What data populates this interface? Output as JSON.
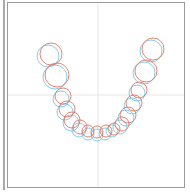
{
  "figure": {
    "type": "dental-arch-overlay",
    "crosshair": {
      "x": 98,
      "y": 95,
      "color": "#e6e6e6"
    },
    "colors": {
      "series_a": "#e0705a",
      "series_b": "#6fc3e6",
      "frame": "#9a9a9a"
    },
    "series": [
      {
        "name": "red",
        "color": "#e0705a",
        "circles": [
          {
            "cx": 51,
            "cy": 54,
            "r": 11
          },
          {
            "cx": 57,
            "cy": 75,
            "r": 12
          },
          {
            "cx": 63,
            "cy": 96,
            "r": 8
          },
          {
            "cx": 67,
            "cy": 109,
            "r": 8
          },
          {
            "cx": 72,
            "cy": 120,
            "r": 8
          },
          {
            "cx": 80,
            "cy": 127,
            "r": 7
          },
          {
            "cx": 88,
            "cy": 131,
            "r": 6
          },
          {
            "cx": 97,
            "cy": 132,
            "r": 6
          },
          {
            "cx": 106,
            "cy": 131,
            "r": 6
          },
          {
            "cx": 114,
            "cy": 129,
            "r": 6
          },
          {
            "cx": 122,
            "cy": 124,
            "r": 7
          },
          {
            "cx": 128,
            "cy": 115,
            "r": 8
          },
          {
            "cx": 134,
            "cy": 103,
            "r": 8
          },
          {
            "cx": 139,
            "cy": 90,
            "r": 8
          },
          {
            "cx": 146,
            "cy": 71,
            "r": 11
          },
          {
            "cx": 153,
            "cy": 49,
            "r": 11
          }
        ]
      },
      {
        "name": "blue",
        "color": "#6fc3e6",
        "circles": [
          {
            "cx": 48,
            "cy": 56,
            "r": 11
          },
          {
            "cx": 55,
            "cy": 77,
            "r": 12
          },
          {
            "cx": 61,
            "cy": 99,
            "r": 8
          },
          {
            "cx": 65,
            "cy": 112,
            "r": 8
          },
          {
            "cx": 71,
            "cy": 123,
            "r": 8
          },
          {
            "cx": 79,
            "cy": 130,
            "r": 7
          },
          {
            "cx": 88,
            "cy": 134,
            "r": 6
          },
          {
            "cx": 97,
            "cy": 135,
            "r": 6
          },
          {
            "cx": 105,
            "cy": 134,
            "r": 6
          },
          {
            "cx": 112,
            "cy": 131,
            "r": 6
          },
          {
            "cx": 120,
            "cy": 127,
            "r": 7
          },
          {
            "cx": 126,
            "cy": 118,
            "r": 8
          },
          {
            "cx": 132,
            "cy": 106,
            "r": 8
          },
          {
            "cx": 137,
            "cy": 93,
            "r": 8
          },
          {
            "cx": 144,
            "cy": 73,
            "r": 11
          },
          {
            "cx": 151,
            "cy": 51,
            "r": 11
          }
        ]
      }
    ]
  }
}
